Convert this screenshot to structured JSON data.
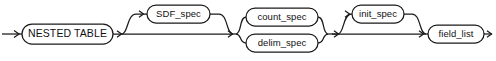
{
  "diagram": {
    "type": "railroad-syntax-diagram",
    "name": "nested_table_clause",
    "line_color": "#1a1a1a",
    "background_color": "#ffffff",
    "nodes": [
      {
        "id": "nested_table",
        "label": "NESTED TABLE",
        "kind": "keyword",
        "shape": "stadium",
        "x": 22,
        "y": 24,
        "w": 91,
        "h": 20,
        "optional": false
      },
      {
        "id": "sdf_spec",
        "label": "SDF_spec",
        "kind": "nonterminal",
        "shape": "stadium",
        "x": 147,
        "y": 5,
        "w": 63,
        "h": 18,
        "optional": true
      },
      {
        "id": "count_spec",
        "label": "count_spec",
        "kind": "nonterminal",
        "shape": "stadium",
        "x": 246,
        "y": 8,
        "w": 72,
        "h": 18,
        "optional": false
      },
      {
        "id": "delim_spec",
        "label": "delim_spec",
        "kind": "nonterminal",
        "shape": "stadium",
        "x": 246,
        "y": 34,
        "w": 72,
        "h": 18,
        "optional": false
      },
      {
        "id": "init_spec",
        "label": "init_spec",
        "kind": "nonterminal",
        "shape": "stadium",
        "x": 352,
        "y": 5,
        "w": 52,
        "h": 18,
        "optional": true
      },
      {
        "id": "field_list",
        "label": "field_list",
        "kind": "nonterminal",
        "shape": "stadium",
        "x": 428,
        "y": 25,
        "w": 56,
        "h": 18,
        "optional": false
      }
    ],
    "baseline_y": 34,
    "entry_arrow": true,
    "exit_arrow": true
  }
}
